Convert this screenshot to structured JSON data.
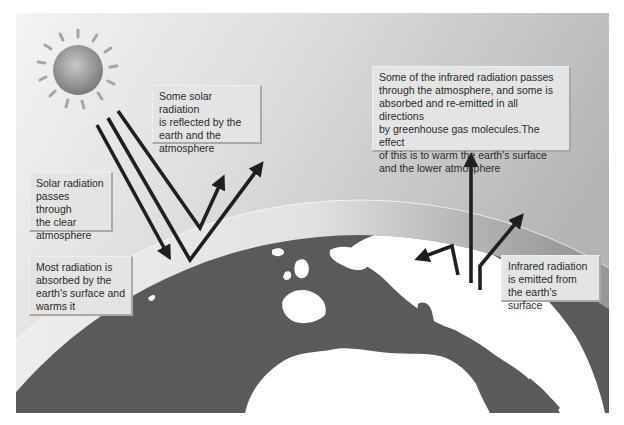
{
  "diagram": {
    "labels": {
      "solar_reflected": "Some solar radiation\nis reflected by the\nearth and the\natmosphere",
      "solar_passes": "Solar radiation\npasses through\nthe clear\natmosphere",
      "absorbed": "Most radiation is\nabsorbed by the\nearth's surface and\nwarms it",
      "infrared_passes": "Some of the infrared radiation passes\nthrough the atmosphere, and some is\nabsorbed and re-emitted in all directions\nby greenhouse gas molecules.The effect\nof this is to warm the earth's surface\nand the lower atmosphere",
      "infrared_emitted": "Infrared radiation\nis emitted from\nthe earth's surface"
    },
    "elements": {
      "sun": "sun-icon",
      "earth": "earth-globe",
      "atmosphere": "atmosphere-band",
      "arrows": [
        "solar-incoming-arrow",
        "solar-reflected-arrow",
        "infrared-arrow"
      ]
    },
    "colors": {
      "ocean": "#5a5a5a",
      "land": "#ffffff",
      "arrow": "#1f1f1f",
      "sun": "#8c8c8c",
      "label_bg": "#e4e4e4"
    }
  }
}
